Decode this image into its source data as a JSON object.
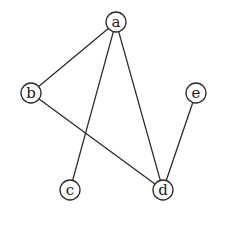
{
  "diagram": {
    "type": "undirected-graph",
    "stroke_color": "#2a2a2a",
    "node_fill": "#ffffff",
    "node_radius": 10,
    "nodes": [
      {
        "id": "a",
        "label": "a",
        "x": 116,
        "y": 22
      },
      {
        "id": "b",
        "label": "b",
        "x": 31,
        "y": 93
      },
      {
        "id": "e",
        "label": "e",
        "x": 196,
        "y": 93
      },
      {
        "id": "c",
        "label": "c",
        "x": 70,
        "y": 190
      },
      {
        "id": "d",
        "label": "d",
        "x": 163,
        "y": 190
      }
    ],
    "edges": [
      {
        "from": "a",
        "to": "b"
      },
      {
        "from": "a",
        "to": "c"
      },
      {
        "from": "a",
        "to": "d"
      },
      {
        "from": "b",
        "to": "d"
      },
      {
        "from": "e",
        "to": "d"
      }
    ]
  }
}
